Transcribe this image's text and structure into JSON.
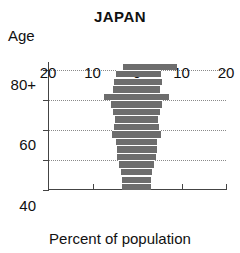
{
  "chart_data": {
    "type": "bar",
    "subtype": "population-pyramid",
    "title": "JAPAN",
    "xlabel": "Percent of population",
    "ylabel": "Age",
    "xlim": [
      -20,
      20
    ],
    "ylim": [
      0,
      85
    ],
    "xtick_labels": [
      "20",
      "10",
      "0",
      "10",
      "20"
    ],
    "xtick_values": [
      -20,
      -10,
      0,
      10,
      20
    ],
    "ytick_labels": [
      "0",
      "20",
      "40",
      "60",
      "80+"
    ],
    "ytick_values": [
      0,
      20,
      40,
      60,
      80
    ],
    "grid": true,
    "grid_axis": "y",
    "legend": "none",
    "bar_color": "#6d6d6d",
    "categories": [
      "0-4",
      "5-9",
      "10-14",
      "15-19",
      "20-24",
      "25-29",
      "30-34",
      "35-39",
      "40-44",
      "45-49",
      "50-54",
      "55-59",
      "60-64",
      "65-69",
      "70-74",
      "75-79",
      "80+"
    ],
    "series": [
      {
        "name": "Male",
        "side": "left",
        "values": [
          3.4,
          3.4,
          3.6,
          4.0,
          4.4,
          4.6,
          4.8,
          5.6,
          5.2,
          5.0,
          5.4,
          5.8,
          7.5,
          5.4,
          5.2,
          4.8,
          3.2
        ]
      },
      {
        "name": "Female",
        "side": "right",
        "values": [
          3.2,
          3.2,
          3.4,
          3.8,
          4.2,
          4.4,
          4.6,
          5.4,
          5.0,
          4.8,
          5.2,
          5.6,
          7.2,
          5.2,
          5.6,
          5.4,
          9.0
        ]
      }
    ]
  }
}
